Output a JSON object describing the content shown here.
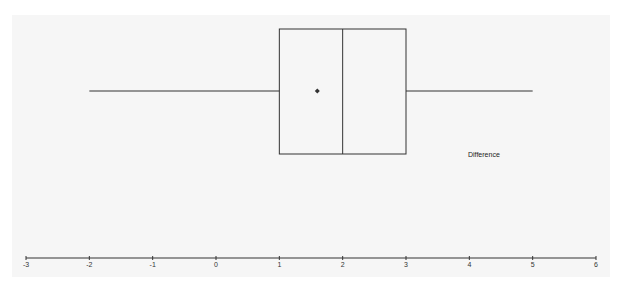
{
  "chart_data": {
    "type": "boxplot",
    "title": "",
    "xlabel": "",
    "ylabel": "",
    "orientation": "horizontal",
    "series": [
      {
        "name": "Difference",
        "min": -2,
        "q1": 1,
        "median": 2,
        "q3": 3,
        "max": 5,
        "mean": 1.6
      }
    ],
    "xlim": [
      -3,
      6
    ],
    "x_ticks": [
      "-3",
      "-2",
      "-1",
      "0",
      "1",
      "2",
      "3",
      "4",
      "5",
      "6"
    ],
    "grid": false,
    "legend_position": "inside right"
  },
  "colors": {
    "background": "#f6f6f6",
    "line": "#333333"
  }
}
